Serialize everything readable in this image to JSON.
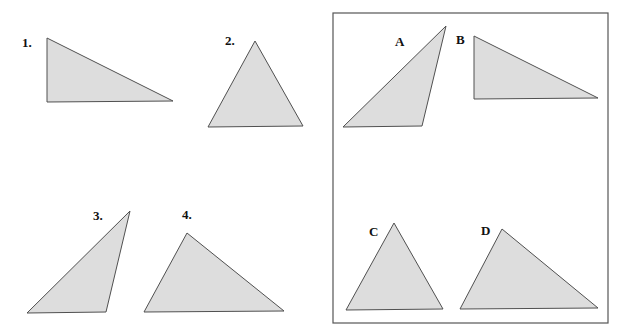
{
  "colors": {
    "fill": "#dddddd",
    "stroke": "#505050",
    "background": "#ffffff"
  },
  "left_group": {
    "shapes": [
      {
        "id": "tri-1",
        "label": "1.",
        "label_pos": [
          22,
          47
        ],
        "points": "47,38 47,102 173,101"
      },
      {
        "id": "tri-2",
        "label": "2.",
        "label_pos": [
          225,
          45
        ],
        "points": "255,41 208,127 303,126"
      },
      {
        "id": "tri-3",
        "label": "3.",
        "label_pos": [
          93,
          220
        ],
        "points": "130,211 27,313 106,312"
      },
      {
        "id": "tri-4",
        "label": "4.",
        "label_pos": [
          182,
          219
        ],
        "points": "187,233 144,312 284,311"
      }
    ]
  },
  "answer_box": {
    "rect": {
      "x": 333,
      "y": 13,
      "width": 275,
      "height": 310
    },
    "shapes": [
      {
        "id": "tri-A",
        "label": "A",
        "label_pos": [
          395,
          46
        ],
        "points": "446,26 343,127 422,126"
      },
      {
        "id": "tri-B",
        "label": "B",
        "label_pos": [
          456,
          44
        ],
        "points": "474,36 474,99 598,98"
      },
      {
        "id": "tri-C",
        "label": "C",
        "label_pos": [
          369,
          236
        ],
        "points": "394,223 346,310 443,309"
      },
      {
        "id": "tri-D",
        "label": "D",
        "label_pos": [
          481,
          235
        ],
        "points": "502,229 460,309 598,308"
      }
    ]
  }
}
